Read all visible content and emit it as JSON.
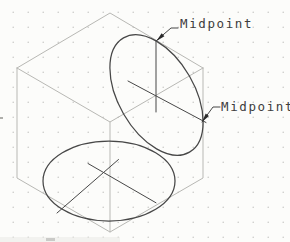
{
  "annotations": {
    "midpoint_top": "Midpoint",
    "midpoint_right": "Midpoint"
  },
  "colors": {
    "background": "#fcfcfa",
    "grid_dot": "#c6c6c2",
    "cube_gray": "#b8b8b4",
    "line_dark": "#474747",
    "arrow_fill": "#2a2a2a",
    "text": "#3d3d3d",
    "scan_smudge": "#e9e9e5",
    "scan_speck": "#9a9a96"
  }
}
